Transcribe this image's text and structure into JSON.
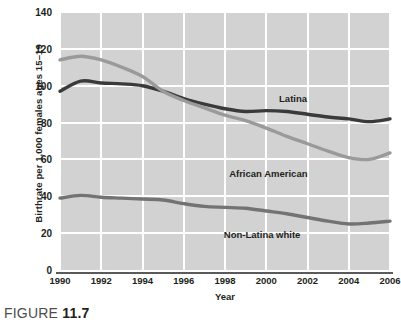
{
  "figure": {
    "caption_prefix": "FIGURE",
    "caption_number": "11.7"
  },
  "colors": {
    "plot_background": "#d2d2d2",
    "gridline": "#ffffff",
    "axis": "#5a5a5a",
    "latina": "#3a3a3a",
    "african_american": "#9a9a9a",
    "non_latina_white": "#737373",
    "text": "#231f20"
  },
  "chart_data": {
    "type": "line",
    "title": "",
    "xlabel": "Year",
    "ylabel": "Birthrate per 1,000 females ages 15–19",
    "xlim": [
      1990,
      2006
    ],
    "ylim": [
      0,
      140
    ],
    "yticks": [
      0,
      20,
      40,
      60,
      80,
      100,
      120,
      140
    ],
    "xticks": [
      1990,
      1992,
      1994,
      1996,
      1998,
      2000,
      2002,
      2004,
      2006
    ],
    "grid": true,
    "legend_position": "inline-annotation",
    "x": [
      1990,
      1991,
      1992,
      1993,
      1994,
      1995,
      1996,
      1997,
      1998,
      1999,
      2000,
      2001,
      2002,
      2003,
      2004,
      2005,
      2006
    ],
    "series": [
      {
        "name": "Latina",
        "color": "#3a3a3a",
        "values": [
          97,
          102.5,
          101.5,
          101,
          100,
          97,
          93,
          90,
          87.5,
          86,
          86.5,
          86,
          84.5,
          83,
          82,
          80.5,
          82
        ],
        "label_x": 2001.3,
        "label_y": 93
      },
      {
        "name": "African American",
        "color": "#9a9a9a",
        "values": [
          114,
          116,
          114,
          110,
          105,
          97,
          92,
          88,
          84,
          81,
          77,
          72.5,
          68.5,
          64.5,
          61,
          60,
          63.5
        ],
        "label_x": 2000.1,
        "label_y": 52
      },
      {
        "name": "Non-Latina white",
        "color": "#737373",
        "values": [
          39,
          40.5,
          39.5,
          39,
          38.5,
          38,
          36,
          34.5,
          34,
          33.5,
          32,
          30.5,
          28.5,
          26.5,
          25,
          25.5,
          26.5
        ],
        "label_x": 1999.8,
        "label_y": 19
      }
    ]
  }
}
